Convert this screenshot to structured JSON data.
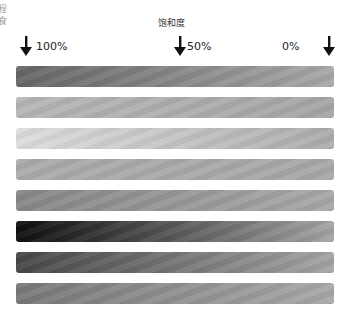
{
  "edge_text": "程 食",
  "header": {
    "title": "饱和度"
  },
  "markers": [
    {
      "label": "100%",
      "icon": "arrow-down-icon"
    },
    {
      "label": "50%",
      "icon": "arrow-down-icon"
    },
    {
      "label": "0%",
      "icon": ""
    },
    {
      "label": "",
      "icon": "arrow-down-icon"
    }
  ],
  "bars": [
    {
      "from": "#666666",
      "to": "#a8a8a8"
    },
    {
      "from": "#b6b6b6",
      "to": "#a6a6a6"
    },
    {
      "from": "#dddddd",
      "to": "#acacac"
    },
    {
      "from": "#ababab",
      "to": "#a8a8a8"
    },
    {
      "from": "#878787",
      "to": "#a8a8a8"
    },
    {
      "from": "#0e0e0e",
      "to": "#a4a4a4"
    },
    {
      "from": "#474747",
      "to": "#a4a4a4"
    },
    {
      "from": "#787878",
      "to": "#a8a8a8"
    }
  ]
}
